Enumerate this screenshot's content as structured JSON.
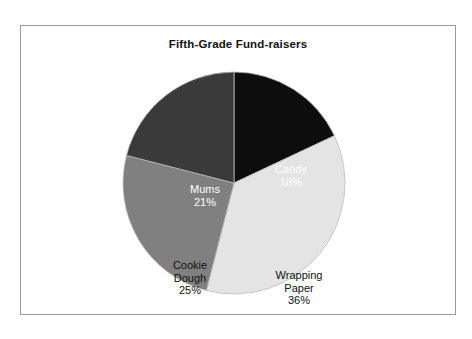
{
  "figure": {
    "title": "Fifth-Grade Fund-raisers",
    "background_color": "#ffffff",
    "border_color": "#9a9a9a"
  },
  "chart_data": {
    "type": "pie",
    "title": "Fifth-Grade Fund-raisers",
    "xlabel": "",
    "ylabel": "",
    "legend": "none",
    "grid": false,
    "start_angle_deg": 90,
    "direction": "clockwise",
    "categories": [
      "Candy",
      "Wrapping Paper",
      "Cookie Dough",
      "Mums"
    ],
    "values": [
      18,
      36,
      25,
      21
    ],
    "value_unit": "percent",
    "slices": [
      {
        "name": "Candy",
        "label": "Candy\n18%",
        "value": 18,
        "percent_text": "18%",
        "color": "#0d0d0d",
        "label_color": "#ffffff",
        "angle_deg": 64.8
      },
      {
        "name": "Wrapping Paper",
        "label": "Wrapping\nPaper\n36%",
        "value": 36,
        "percent_text": "36%",
        "color": "#e4e4e4",
        "label_color": "#111111",
        "angle_deg": 129.6
      },
      {
        "name": "Cookie Dough",
        "label": "Cookie\nDough\n25%",
        "value": 25,
        "percent_text": "25%",
        "color": "#808080",
        "label_color": "#111111",
        "angle_deg": 90.0
      },
      {
        "name": "Mums",
        "label": "Mums\n21%",
        "value": 21,
        "percent_text": "21%",
        "color": "#3a3a3a",
        "label_color": "#ffffff",
        "angle_deg": 75.6
      }
    ]
  }
}
